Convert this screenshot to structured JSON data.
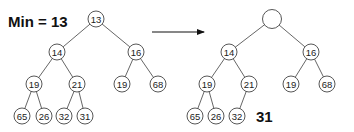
{
  "title": "Min = 13",
  "arrow": {
    "from": [
      152,
      32
    ],
    "to": [
      204,
      32
    ]
  },
  "left_tree": {
    "nodes": [
      {
        "id": "l0",
        "label": "13",
        "x": 96,
        "y": 19
      },
      {
        "id": "l1",
        "label": "14",
        "x": 57,
        "y": 52
      },
      {
        "id": "l2",
        "label": "16",
        "x": 136,
        "y": 52
      },
      {
        "id": "l3",
        "label": "19",
        "x": 34,
        "y": 84
      },
      {
        "id": "l4",
        "label": "21",
        "x": 77,
        "y": 84
      },
      {
        "id": "l5",
        "label": "19",
        "x": 122,
        "y": 84
      },
      {
        "id": "l6",
        "label": "68",
        "x": 158,
        "y": 84
      },
      {
        "id": "l7",
        "label": "65",
        "x": 22,
        "y": 116
      },
      {
        "id": "l8",
        "label": "26",
        "x": 44,
        "y": 116
      },
      {
        "id": "l9",
        "label": "32",
        "x": 64,
        "y": 116
      },
      {
        "id": "l10",
        "label": "31",
        "x": 85,
        "y": 116
      }
    ],
    "edges": [
      [
        "l0",
        "l1"
      ],
      [
        "l0",
        "l2"
      ],
      [
        "l1",
        "l3"
      ],
      [
        "l1",
        "l4"
      ],
      [
        "l2",
        "l5"
      ],
      [
        "l2",
        "l6"
      ],
      [
        "l3",
        "l7"
      ],
      [
        "l3",
        "l8"
      ],
      [
        "l4",
        "l9"
      ],
      [
        "l4",
        "l10"
      ]
    ]
  },
  "right_tree": {
    "nodes": [
      {
        "id": "r0",
        "label": "",
        "x": 272,
        "y": 19,
        "r": 9.5
      },
      {
        "id": "r1",
        "label": "14",
        "x": 229,
        "y": 52
      },
      {
        "id": "r2",
        "label": "16",
        "x": 311,
        "y": 52
      },
      {
        "id": "r3",
        "label": "19",
        "x": 207,
        "y": 84
      },
      {
        "id": "r4",
        "label": "21",
        "x": 249,
        "y": 84
      },
      {
        "id": "r5",
        "label": "19",
        "x": 291,
        "y": 84
      },
      {
        "id": "r6",
        "label": "68",
        "x": 327,
        "y": 84
      },
      {
        "id": "r7",
        "label": "65",
        "x": 195,
        "y": 116
      },
      {
        "id": "r8",
        "label": "26",
        "x": 216,
        "y": 116
      },
      {
        "id": "r9",
        "label": "32",
        "x": 237,
        "y": 116
      }
    ],
    "edges": [
      [
        "r0",
        "r1"
      ],
      [
        "r0",
        "r2"
      ],
      [
        "r1",
        "r3"
      ],
      [
        "r1",
        "r4"
      ],
      [
        "r2",
        "r5"
      ],
      [
        "r2",
        "r6"
      ],
      [
        "r3",
        "r7"
      ],
      [
        "r3",
        "r8"
      ],
      [
        "r4",
        "r9"
      ]
    ]
  },
  "removed_value": {
    "label": "31",
    "x": 256,
    "y": 116
  }
}
